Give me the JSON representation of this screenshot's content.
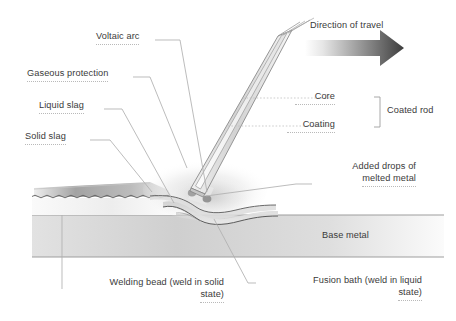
{
  "diagram": {
    "labels": {
      "voltaic_arc": "Voltaic arc",
      "gaseous_protection": "Gaseous protection",
      "liquid_slag": "Liquid slag",
      "solid_slag": "Solid slag",
      "direction_of_travel": "Direction of travel",
      "core": "Core",
      "coating": "Coating",
      "coated_rod": "Coated rod",
      "added_drops_line1": "Added drops of",
      "added_drops_line2": "melted metal",
      "base_metal": "Base metal",
      "welding_bead_line1": "Welding bead (weld in solid",
      "welding_bead_line2": "state)",
      "fusion_bath_line1": "Fusion bath (weld in liquid",
      "fusion_bath_line2": "state)"
    },
    "colors": {
      "text": "#3a3a3a",
      "leader_line": "#b0b0b0",
      "underline_dotted": "#b9b9b9",
      "rod_outline": "#8a8a8a",
      "rod_fill_light": "#f2f2f2",
      "rod_fill_mid": "#cfcfcf",
      "arrow_dark": "#3d3d3d",
      "arrow_light": "#f0f0f0",
      "base_metal_fill": "#d7d7d7",
      "slag_dark": "#8f8f8f",
      "pool_outline": "#4a4a4a",
      "droplet": "#9a9a9a",
      "background": "#ffffff"
    },
    "elements": {
      "electrode_droplet_count": 3,
      "arrow_direction": "right",
      "bracket_side": "right"
    }
  }
}
